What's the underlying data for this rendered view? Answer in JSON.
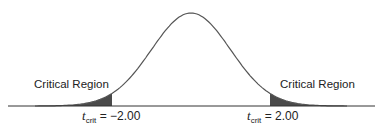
{
  "diagram": {
    "type": "t-distribution critical regions (two-tailed)",
    "left_region_label": "Critical Region",
    "right_region_label": "Critical Region",
    "left_critical": {
      "symbol": "t",
      "subscript": "crit",
      "equals": " = ",
      "value": "−2.00"
    },
    "right_critical": {
      "symbol": "t",
      "subscript": "crit",
      "equals": " = ",
      "value": "2.00"
    },
    "critical_values": [
      -2.0,
      2.0
    ],
    "shade_color": "#4a4a4a",
    "curve_color": "#555555"
  }
}
